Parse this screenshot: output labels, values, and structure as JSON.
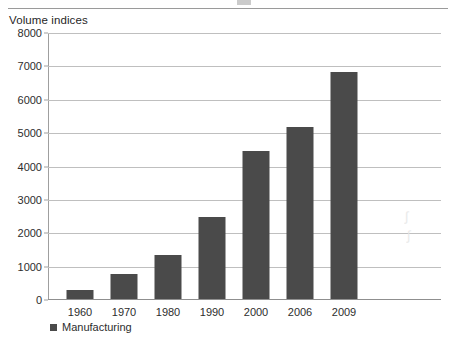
{
  "chart_data": {
    "type": "bar",
    "title": "",
    "ylabel": "Volume indices",
    "xlabel": "",
    "categories": [
      "1960",
      "1970",
      "1980",
      "1990",
      "2000",
      "2006",
      "2009"
    ],
    "series": [
      {
        "name": "Manufacturing",
        "color": "#4a4a4a",
        "values": [
          270,
          750,
          1320,
          2460,
          4430,
          5150,
          6800
        ]
      }
    ],
    "ylim": [
      0,
      8000
    ],
    "ytick_labels": [
      "0",
      "1000",
      "2000",
      "3000",
      "4000",
      "5000",
      "6000",
      "7000",
      "8000"
    ],
    "ytick_values": [
      0,
      1000,
      2000,
      3000,
      4000,
      5000,
      6000,
      7000,
      8000
    ],
    "grid": true,
    "legend_position": "bottom-left",
    "legend_entries": [
      "Manufacturing"
    ]
  },
  "figure": {
    "axis_title": "Volume indices",
    "legend_marker": "square-marker",
    "watermark_a": "∫",
    "watermark_b": "∫"
  }
}
